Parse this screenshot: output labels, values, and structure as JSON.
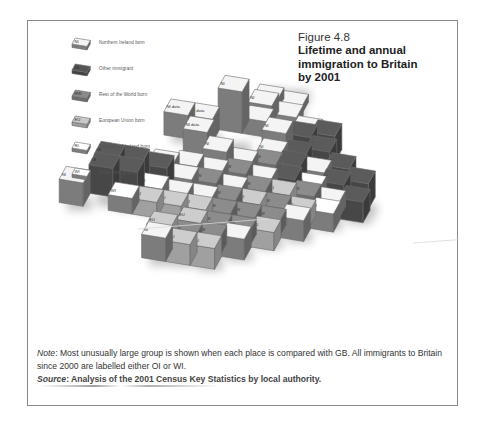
{
  "figure": {
    "number": "Figure 4.8",
    "title_lines": [
      "Lifetime and annual",
      "immigration to Britain",
      "by 2001"
    ]
  },
  "legend": [
    {
      "code": "NI",
      "label": "Northern Ireland born",
      "color": "#f4f4f4"
    },
    {
      "code": "OI",
      "label": "Other immigrant",
      "color": "#555555"
    },
    {
      "code": "RW",
      "label": "Rest of the World born",
      "color": "#8a8a8a"
    },
    {
      "code": "EU",
      "label": "European Union born",
      "color": "#c9c9c9"
    },
    {
      "code": "RI",
      "label": "Republic of Ireland born",
      "color": "#ffffff"
    },
    {
      "code": "WI",
      "label": "White immigrant",
      "color": "#ffffff"
    }
  ],
  "colors": {
    "NI": "#f4f4f4",
    "OI": "#5b5b5b",
    "RW": "#8c8c8c",
    "EU": "#cdcdcd",
    "RI": "#ffffff",
    "WI": "#ffffff",
    "side": "#7c7c7c",
    "edge": "#6a6a6a"
  },
  "map": {
    "note_missing": "data",
    "cells": [
      {
        "r": 0,
        "c": 6,
        "code": "NI",
        "h": 0.4
      },
      {
        "r": 0,
        "c": 7,
        "code": "NI",
        "h": 0.3
      },
      {
        "r": 1,
        "c": 6,
        "code": "NI",
        "h": 0.7
      },
      {
        "r": 1,
        "c": 7,
        "code": "NI",
        "h": 0.4
      },
      {
        "r": 2,
        "c": 5,
        "code": "NI",
        "h": 1.6
      },
      {
        "r": 2,
        "c": 6,
        "code": "NI",
        "h": 0.6
      },
      {
        "r": 2,
        "c": 8,
        "code": "NI",
        "h": 0.5
      },
      {
        "r": 3,
        "c": 3,
        "code": "NI",
        "h": 0.9,
        "text": "NI data"
      },
      {
        "r": 3,
        "c": 4,
        "code": "NI",
        "h": 0.9,
        "text": "NI data"
      },
      {
        "r": 3,
        "c": 7,
        "code": "NI",
        "h": 0.8
      },
      {
        "r": 3,
        "c": 8,
        "code": "OI",
        "h": 0.8
      },
      {
        "r": 3,
        "c": 9,
        "code": "OI",
        "h": 1.0
      },
      {
        "r": 4,
        "c": 4,
        "code": "NI",
        "h": 0.9,
        "text": "NI data"
      },
      {
        "r": 4,
        "c": 7,
        "code": "NI",
        "h": 0.5
      },
      {
        "r": 4,
        "c": 8,
        "code": "OI",
        "h": 0.6
      },
      {
        "r": 4,
        "c": 9,
        "code": "OI",
        "h": 0.9
      },
      {
        "r": 5,
        "c": 5,
        "code": "NI",
        "h": 0.8
      },
      {
        "r": 5,
        "c": 6,
        "code": "NI",
        "h": 0.5
      },
      {
        "r": 5,
        "c": 7,
        "code": "RW",
        "h": 0.6
      },
      {
        "r": 5,
        "c": 8,
        "code": "OI",
        "h": 0.7
      },
      {
        "r": 5,
        "c": 9,
        "code": "NI",
        "h": 0.6
      },
      {
        "r": 5,
        "c": 10,
        "code": "OI",
        "h": 0.9
      },
      {
        "r": 6,
        "c": 3,
        "code": "NI",
        "h": 0.5
      },
      {
        "r": 6,
        "c": 4,
        "code": "NI",
        "h": 0.6
      },
      {
        "r": 6,
        "c": 5,
        "code": "NI",
        "h": 0.5
      },
      {
        "r": 6,
        "c": 6,
        "code": "RW",
        "h": 0.6
      },
      {
        "r": 6,
        "c": 7,
        "code": "NI",
        "h": 0.5
      },
      {
        "r": 6,
        "c": 8,
        "code": "OI",
        "h": 0.7
      },
      {
        "r": 6,
        "c": 9,
        "code": "WI",
        "h": 0.5
      },
      {
        "r": 6,
        "c": 10,
        "code": "OI",
        "h": 0.8
      },
      {
        "r": 6,
        "c": 11,
        "code": "OI",
        "h": 1.0
      },
      {
        "r": 7,
        "c": 1,
        "code": "OI",
        "h": 1.0
      },
      {
        "r": 7,
        "c": 2,
        "code": "OI",
        "h": 1.0
      },
      {
        "r": 7,
        "c": 3,
        "code": "OI",
        "h": 0.9
      },
      {
        "r": 7,
        "c": 4,
        "code": "NI",
        "h": 0.6
      },
      {
        "r": 7,
        "c": 5,
        "code": "RW",
        "h": 0.6
      },
      {
        "r": 7,
        "c": 6,
        "code": "NI",
        "h": 0.5
      },
      {
        "r": 7,
        "c": 7,
        "code": "RW",
        "h": 0.6
      },
      {
        "r": 7,
        "c": 8,
        "code": "EU",
        "h": 0.6
      },
      {
        "r": 7,
        "c": 9,
        "code": "RW",
        "h": 0.7
      },
      {
        "r": 7,
        "c": 10,
        "code": "NI",
        "h": 0.6
      },
      {
        "r": 7,
        "c": 11,
        "code": "OI",
        "h": 0.8
      },
      {
        "r": 8,
        "c": 1,
        "code": "OI",
        "h": 1.1
      },
      {
        "r": 8,
        "c": 2,
        "code": "OI",
        "h": 1.1
      },
      {
        "r": 8,
        "c": 3,
        "code": "WI",
        "h": 0.6
      },
      {
        "r": 8,
        "c": 4,
        "code": "NI",
        "h": 0.5
      },
      {
        "r": 8,
        "c": 5,
        "code": "NI",
        "h": 0.5
      },
      {
        "r": 8,
        "c": 6,
        "code": "RW",
        "h": 0.6
      },
      {
        "r": 8,
        "c": 7,
        "code": "EU",
        "h": 0.6
      },
      {
        "r": 8,
        "c": 8,
        "code": "RW",
        "h": 0.6
      },
      {
        "r": 8,
        "c": 9,
        "code": "EU",
        "h": 0.6
      },
      {
        "r": 8,
        "c": 10,
        "code": "WI",
        "h": 0.7
      },
      {
        "r": 9,
        "c": 0,
        "code": "NI",
        "h": 0.9
      },
      {
        "r": 9,
        "c": 2,
        "code": "WI",
        "h": 0.6
      },
      {
        "r": 9,
        "c": 3,
        "code": "EU",
        "h": 0.6
      },
      {
        "r": 9,
        "c": 4,
        "code": "EU",
        "h": 0.6
      },
      {
        "r": 9,
        "c": 5,
        "code": "EU",
        "h": 0.6
      },
      {
        "r": 9,
        "c": 6,
        "code": "RW",
        "h": 0.6
      },
      {
        "r": 9,
        "c": 7,
        "code": "RW",
        "h": 0.6
      },
      {
        "r": 9,
        "c": 8,
        "code": "RW",
        "h": 0.6
      },
      {
        "r": 9,
        "c": 9,
        "code": "NI",
        "h": 0.8
      },
      {
        "r": 10,
        "c": 5,
        "code": "EU",
        "h": 0.6
      },
      {
        "r": 10,
        "c": 6,
        "code": "RW",
        "h": 0.6
      },
      {
        "r": 10,
        "c": 7,
        "code": "RW",
        "h": 0.6
      },
      {
        "r": 10,
        "c": 8,
        "code": "EU",
        "h": 0.7
      },
      {
        "r": 11,
        "c": 4,
        "code": "EU",
        "h": 0.8
      },
      {
        "r": 11,
        "c": 5,
        "code": "RW",
        "h": 0.6
      },
      {
        "r": 11,
        "c": 6,
        "code": "RW",
        "h": 0.7
      },
      {
        "r": 11,
        "c": 7,
        "code": "NI",
        "h": 0.8
      },
      {
        "r": 12,
        "c": 4,
        "code": "NI",
        "h": 0.9
      },
      {
        "r": 12,
        "c": 5,
        "code": "EU",
        "h": 0.8
      },
      {
        "r": 12,
        "c": 6,
        "code": "EU",
        "h": 0.8
      }
    ]
  },
  "note": {
    "label": "Note",
    "text": ": Most unusually large group is shown when each place is compared with GB. All immigrants to Britain since 2000 are labelled either OI or WI."
  },
  "source": {
    "label": "Source",
    "text": ": Analysis of the 2001 Census Key Statistics by local authority."
  }
}
